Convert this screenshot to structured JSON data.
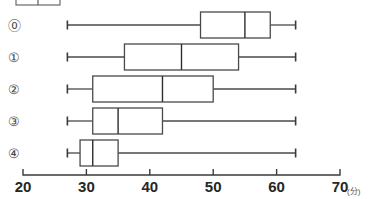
{
  "chart_data": {
    "type": "box",
    "title": "",
    "xlabel": "",
    "ylabel": "",
    "unit_label": "(分)",
    "xlim": [
      20,
      70
    ],
    "xticks": [
      20,
      30,
      40,
      50,
      60,
      70
    ],
    "xtick_labels": [
      "20",
      "30",
      "40",
      "50",
      "60",
      "70"
    ],
    "grid": false,
    "legend": "none",
    "orientation": "horizontal",
    "categories": [
      "⓪",
      "①",
      "②",
      "③",
      "④"
    ],
    "boxes": [
      {
        "label": "⓪",
        "min": 27,
        "q1": 48,
        "median": 55,
        "q3": 59,
        "max": 63
      },
      {
        "label": "①",
        "min": 27,
        "q1": 36,
        "median": 45,
        "q3": 54,
        "max": 63
      },
      {
        "label": "②",
        "min": 27,
        "q1": 31,
        "median": 42,
        "q3": 50,
        "max": 63
      },
      {
        "label": "③",
        "min": 27,
        "q1": 31,
        "median": 35,
        "q3": 42,
        "max": 63
      },
      {
        "label": "④",
        "min": 27,
        "q1": 29,
        "median": 31,
        "q3": 35,
        "max": 63
      }
    ]
  },
  "colors": {
    "box_stroke": "#4a4a4a",
    "median_stroke": "#2e2e2e",
    "whisker_stroke": "#4a4a4a",
    "axis_stroke": "#3a3a3a",
    "tick_text": "#262626",
    "background": "#ffffff"
  },
  "clipped_top_element": {
    "present": true,
    "description": "partial-box-plot-above"
  }
}
